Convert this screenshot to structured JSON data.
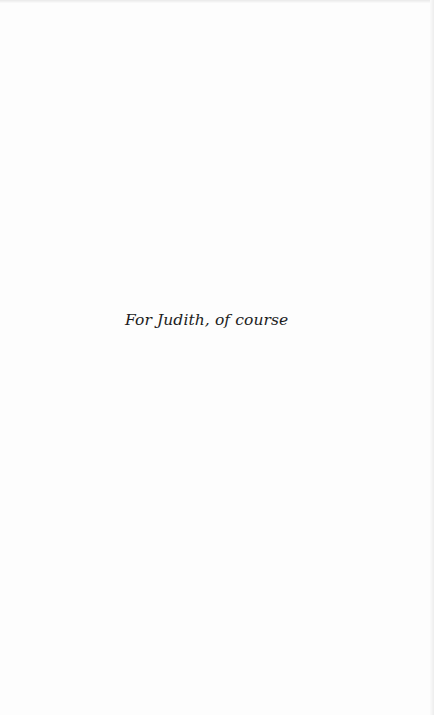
{
  "page": {
    "type": "dedication",
    "background_color": "#fdfdfd",
    "text_color": "#1c1c1c"
  },
  "dedication": {
    "text": "For Judith, of course"
  }
}
